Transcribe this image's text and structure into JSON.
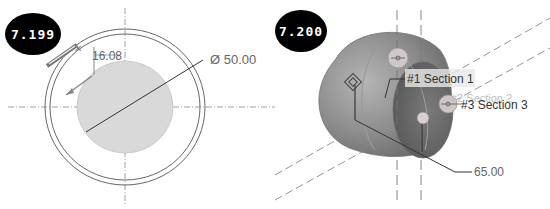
{
  "figures": [
    {
      "id": "left",
      "figure_number": "7.199",
      "dimensions": {
        "offset_label": "16.08",
        "diameter_label": "Ø 50.00"
      }
    },
    {
      "id": "right",
      "figure_number": "7.200",
      "sections": [
        {
          "label": "#1 Section 1"
        },
        {
          "label": "#2 Section 2"
        },
        {
          "label": "#3 Section 3"
        }
      ],
      "dimensions": {
        "length_label": "65.00"
      }
    }
  ],
  "colors": {
    "badge_bg": "#000000",
    "badge_text": "#ffffff",
    "disc_fill": "#d9d9d9",
    "solid_fill": "#8c8c8c",
    "line": "#555555"
  }
}
